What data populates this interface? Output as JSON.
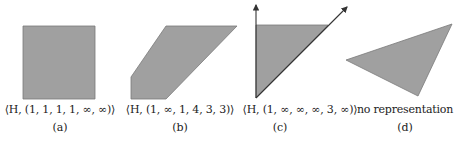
{
  "colors": {
    "fill": "#a0a0a0",
    "stroke": "#7a7a7a",
    "arrow": "#333333",
    "text": "#222222"
  },
  "panels": [
    {
      "id": "a",
      "caption": "⟨H, (1, 1, 1, 1, ∞, ∞)⟩",
      "sublabel": "(a)",
      "shape": "square"
    },
    {
      "id": "b",
      "caption": "⟨H, (1, ∞, 1, 4, 3, 3)⟩",
      "sublabel": "(b)",
      "shape": "hexagon"
    },
    {
      "id": "c",
      "caption": "⟨H, (1, ∞, ∞, ∞, 3, ∞)⟩",
      "sublabel": "(c)",
      "shape": "triangle-with-rays"
    },
    {
      "id": "d",
      "caption": "no representation",
      "sublabel": "(d)",
      "shape": "triangle"
    }
  ]
}
